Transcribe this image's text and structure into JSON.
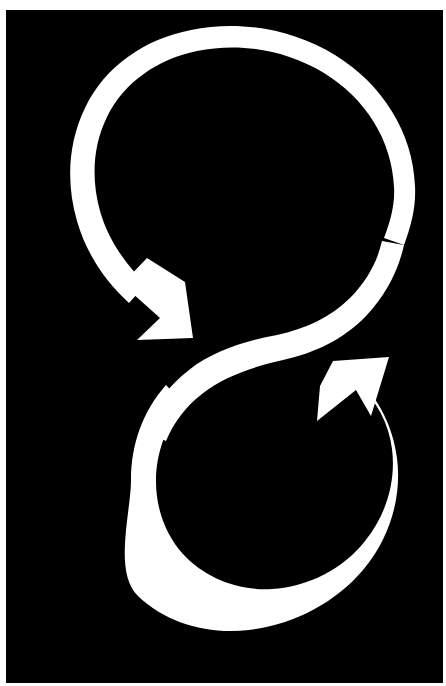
{
  "image": {
    "title": "Cyclic double arrow symbol",
    "alt_text": "Two interlocking circular arrows forming a figure-eight cycle",
    "width_px": 446,
    "height_px": 686,
    "orientation": "portrait"
  },
  "colors": {
    "background": "#ffffff",
    "plate": "#000000",
    "figure": "#ffffff"
  },
  "plate": {
    "left_px": 6,
    "top_px": 10,
    "width_px": 437,
    "height_px": 673
  },
  "figure": {
    "name": "figure-eight-cycle-arrows",
    "stroke_width_px": 25,
    "upper_loop": {
      "label": "upper circular arrow",
      "center_x": 251,
      "center_y": 192,
      "outer_radius_px": 164,
      "direction": "counter-clockwise",
      "bounds": {
        "left": 88,
        "right": 415,
        "top": 27,
        "bottom": 355
      },
      "arrowhead": {
        "name": "upper-arrowhead",
        "tip_x": 175,
        "tip_y": 338,
        "points": "down-right"
      }
    },
    "lower_loop": {
      "label": "lower circular arrow",
      "center_x": 264,
      "center_y": 497,
      "outer_radius_px": 134,
      "direction": "clockwise",
      "bounds": {
        "left": 130,
        "right": 398,
        "top": 363,
        "bottom": 631
      },
      "arrowhead": {
        "name": "lower-arrowhead",
        "tip_x": 333,
        "tip_y": 361,
        "points": "up-left"
      }
    },
    "connector": {
      "label": "s-curve crossover",
      "from_x": 190,
      "from_y": 395,
      "to_x": 352,
      "to_y": 300
    }
  }
}
